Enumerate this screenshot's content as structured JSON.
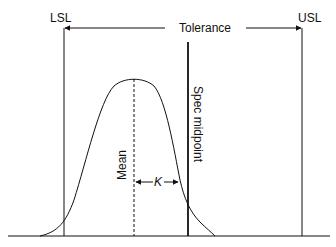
{
  "labels": {
    "lsl": "LSL",
    "usl": "USL",
    "tolerance": "Tolerance",
    "spec_midpoint": "Spec midpoint",
    "mean": "Mean",
    "k": "K"
  },
  "colors": {
    "line": "#111111",
    "background": "#ffffff"
  }
}
